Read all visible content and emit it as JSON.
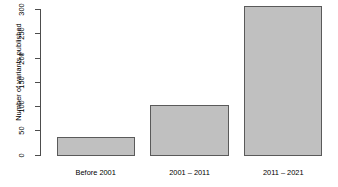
{
  "chart_data": {
    "type": "bar",
    "title": "",
    "xlabel": "",
    "ylabel": "Number of variants published",
    "categories": [
      "Before 2001",
      "2001 – 2011",
      "2011 – 2021"
    ],
    "values": [
      39,
      105,
      310
    ],
    "ylim": [
      0,
      300
    ],
    "yticks": [
      0,
      50,
      100,
      150,
      200,
      250,
      300
    ],
    "ytick_labels": [
      "0",
      "50",
      "100",
      "150",
      "200",
      "250",
      "300"
    ],
    "grid": false,
    "legend": null,
    "bar_fill_color": "#c0c0c0",
    "bar_border_color": "#5a5a5a",
    "axis_color": "#4d4d4d",
    "background_color": "#ffffff"
  }
}
